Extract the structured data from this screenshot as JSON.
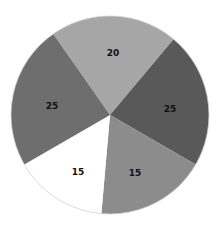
{
  "chart_data": {
    "type": "pie",
    "title": "",
    "center": [
      110,
      115
    ],
    "radius": 99,
    "slices": [
      {
        "label": "20",
        "value": 20,
        "color": "#a6a6a6",
        "start_deg": -35,
        "end_deg": 40,
        "label_pos": [
          113,
          53
        ]
      },
      {
        "label": "25",
        "value": 25,
        "color": "#595959",
        "start_deg": 40,
        "end_deg": 120,
        "label_pos": [
          170,
          109
        ]
      },
      {
        "label": "15",
        "value": 15,
        "color": "#8c8c8c",
        "start_deg": 120,
        "end_deg": 185,
        "label_pos": [
          135,
          173
        ]
      },
      {
        "label": "15",
        "value": 15,
        "color": "#ffffff",
        "start_deg": 185,
        "end_deg": 240,
        "label_pos": [
          78,
          172
        ]
      },
      {
        "label": "25",
        "value": 25,
        "color": "#6e6e6e",
        "start_deg": 240,
        "end_deg": 325,
        "label_pos": [
          52,
          106
        ]
      }
    ],
    "legend": null
  }
}
